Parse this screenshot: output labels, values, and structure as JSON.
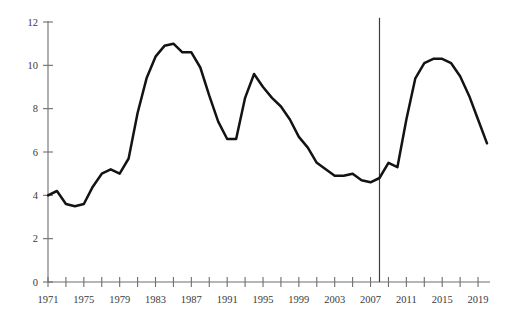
{
  "chart_data": {
    "type": "line",
    "title": "",
    "subtitle": "",
    "xlabel": "",
    "ylabel": "",
    "xlim": [
      1971,
      2020
    ],
    "ylim": [
      0,
      12
    ],
    "ytick_values": [
      0,
      2,
      4,
      6,
      8,
      10,
      12
    ],
    "ytick_labels": [
      "0",
      "2",
      "4",
      "6",
      "8",
      "10",
      "12"
    ],
    "xtick_values": [
      1971,
      1973,
      1975,
      1977,
      1979,
      1981,
      1983,
      1985,
      1987,
      1989,
      1991,
      1993,
      1995,
      1997,
      1999,
      2001,
      2003,
      2005,
      2007,
      2009,
      2011,
      2013,
      2015,
      2017,
      2019
    ],
    "xtick_labels": [
      "1971",
      "",
      "1975",
      "",
      "1979",
      "",
      "1983",
      "",
      "1987",
      "",
      "1991",
      "",
      "1995",
      "",
      "1999",
      "",
      "2003",
      "",
      "2007",
      "",
      "2011",
      "",
      "2015",
      "",
      "2019"
    ],
    "grid": false,
    "legend": "none",
    "line_color": "#131313",
    "axis_color": "#6e6e6e",
    "annotations": [
      {
        "name": "forecast-divider",
        "type": "vertical-line",
        "x": 2008,
        "y_from": 0,
        "y_to": 12.2,
        "color": "#3d3d3d"
      }
    ],
    "series": [
      {
        "name": "unemployment-rate",
        "x": [
          1971,
          1972,
          1973,
          1974,
          1975,
          1976,
          1977,
          1978,
          1979,
          1980,
          1981,
          1982,
          1983,
          1984,
          1985,
          1986,
          1987,
          1988,
          1989,
          1990,
          1991,
          1992,
          1993,
          1994,
          1995,
          1996,
          1997,
          1998,
          1999,
          2000,
          2001,
          2002,
          2003,
          2004,
          2005,
          2006,
          2007,
          2008,
          2009,
          2010,
          2011,
          2012,
          2013,
          2014,
          2015,
          2016,
          2017,
          2018,
          2019,
          2020
        ],
        "y": [
          4.0,
          4.2,
          3.6,
          3.5,
          3.6,
          4.4,
          5.0,
          5.2,
          5.0,
          5.7,
          7.8,
          9.4,
          10.4,
          10.9,
          11.0,
          10.6,
          10.6,
          9.9,
          8.6,
          7.4,
          6.6,
          6.6,
          8.5,
          9.6,
          9.0,
          8.5,
          8.1,
          7.5,
          6.7,
          6.2,
          5.5,
          5.2,
          4.9,
          4.9,
          5.0,
          4.7,
          4.6,
          4.8,
          5.5,
          5.3,
          7.5,
          9.4,
          10.1,
          10.3,
          10.3,
          10.1,
          9.5,
          8.6,
          7.5,
          6.4
        ]
      }
    ]
  }
}
